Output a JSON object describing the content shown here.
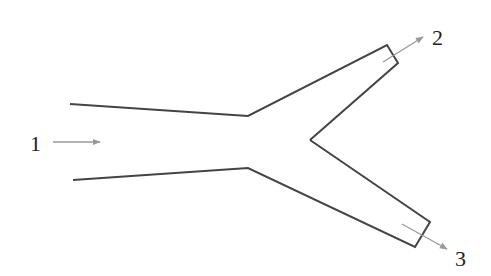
{
  "diagram": {
    "colors": {
      "outline": "#444444",
      "arrow": "#999999",
      "label": "#222222"
    },
    "labels": [
      {
        "id": "1",
        "text": "1",
        "role": "inlet"
      },
      {
        "id": "2",
        "text": "2",
        "role": "outlet-upper"
      },
      {
        "id": "3",
        "text": "3",
        "role": "outlet-lower"
      }
    ]
  }
}
